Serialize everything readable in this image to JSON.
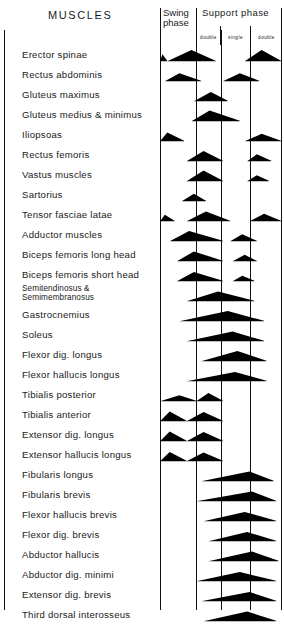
{
  "title": "MUSCLES",
  "header": {
    "swing_phase": "Swing\nphase",
    "support_phase": "Support  phase",
    "sub_phases": [
      "double",
      "single",
      "double"
    ]
  },
  "chart_data": {
    "type": "area",
    "title": "MUSCLES",
    "xlabel": "Gait cycle phase",
    "ylabel": "Muscle",
    "grid": true,
    "legend_position": "none",
    "x_axis": {
      "range": [
        0,
        100
      ],
      "unit": "% gait cycle",
      "phase_boundaries": [
        0,
        30,
        50,
        74,
        100
      ],
      "phase_labels": [
        "Swing phase",
        "double",
        "single",
        "double"
      ],
      "phase_groups": [
        {
          "label": "Swing phase",
          "start": 0,
          "end": 30
        },
        {
          "label": "Support phase",
          "start": 30,
          "end": 100
        }
      ]
    },
    "categories": [
      "Erector spinae",
      "Rectus abdominis",
      "Gluteus maximus",
      "Gluteus medius & minimus",
      "Iliopsoas",
      "Rectus femoris",
      "Vastus muscles",
      "Sartorius",
      "Tensor fasciae latae",
      "Adductor muscles",
      "Biceps femoris long head",
      "Biceps femoris short head",
      "Semitendinosus &\nSemimembranosus",
      "Gastrocnemius",
      "Soleus",
      "Flexor dig. longus",
      "Flexor hallucis longus",
      "Tibialis posterior",
      "Tibialis anterior",
      "Extensor dig. longus",
      "Extensor hallucis longus",
      "Fibularis longus",
      "Fibularis brevis",
      "Flexor hallucis brevis",
      "Flexor dig. brevis",
      "Abductor hallucis",
      "Abductor dig. minimi",
      "Extensor dig. brevis",
      "Third dorsal interosseus"
    ],
    "series": [
      {
        "name": "Erector spinae",
        "bursts": [
          {
            "start": 0,
            "peak": 2,
            "end": 6,
            "amplitude": 0.55
          },
          {
            "start": 6,
            "peak": 26,
            "end": 46,
            "amplitude": 1.0
          },
          {
            "start": 70,
            "peak": 84,
            "end": 100,
            "amplitude": 1.0
          }
        ]
      },
      {
        "name": "Rectus abdominis",
        "bursts": [
          {
            "start": 4,
            "peak": 16,
            "end": 34,
            "amplitude": 0.65
          },
          {
            "start": 52,
            "peak": 66,
            "end": 82,
            "amplitude": 0.65
          }
        ]
      },
      {
        "name": "Gluteus maximus",
        "bursts": [
          {
            "start": 28,
            "peak": 42,
            "end": 56,
            "amplitude": 0.8
          }
        ]
      },
      {
        "name": "Gluteus medius & minimus",
        "bursts": [
          {
            "start": 26,
            "peak": 41,
            "end": 66,
            "amplitude": 0.95
          }
        ]
      },
      {
        "name": "Iliopsoas",
        "bursts": [
          {
            "start": 0,
            "peak": 6,
            "end": 20,
            "amplitude": 0.75
          },
          {
            "start": 70,
            "peak": 84,
            "end": 100,
            "amplitude": 0.6
          }
        ]
      },
      {
        "name": "Rectus femoris",
        "bursts": [
          {
            "start": 22,
            "peak": 36,
            "end": 52,
            "amplitude": 0.9
          },
          {
            "start": 72,
            "peak": 80,
            "end": 92,
            "amplitude": 0.55
          }
        ]
      },
      {
        "name": "Vastus muscles",
        "bursts": [
          {
            "start": 22,
            "peak": 36,
            "end": 52,
            "amplitude": 0.95
          },
          {
            "start": 72,
            "peak": 80,
            "end": 90,
            "amplitude": 0.45
          }
        ]
      },
      {
        "name": "Sartorius",
        "bursts": [
          {
            "start": 18,
            "peak": 28,
            "end": 38,
            "amplitude": 0.6
          }
        ]
      },
      {
        "name": "Tensor fasciae latae",
        "bursts": [
          {
            "start": 0,
            "peak": 4,
            "end": 12,
            "amplitude": 0.5
          },
          {
            "start": 22,
            "peak": 38,
            "end": 58,
            "amplitude": 0.85
          },
          {
            "start": 74,
            "peak": 86,
            "end": 100,
            "amplitude": 0.6
          }
        ]
      },
      {
        "name": "Adductor muscles",
        "bursts": [
          {
            "start": 8,
            "peak": 24,
            "end": 52,
            "amplitude": 0.9
          },
          {
            "start": 58,
            "peak": 68,
            "end": 80,
            "amplitude": 0.55
          }
        ]
      },
      {
        "name": "Biceps femoris long head",
        "bursts": [
          {
            "start": 14,
            "peak": 28,
            "end": 52,
            "amplitude": 0.85
          },
          {
            "start": 60,
            "peak": 70,
            "end": 80,
            "amplitude": 0.5
          }
        ]
      },
      {
        "name": "Biceps femoris short head",
        "bursts": [
          {
            "start": 14,
            "peak": 28,
            "end": 52,
            "amplitude": 0.8
          },
          {
            "start": 60,
            "peak": 68,
            "end": 78,
            "amplitude": 0.4
          }
        ]
      },
      {
        "name": "Semitendinosus & Semimembranosus",
        "bursts": [
          {
            "start": 22,
            "peak": 48,
            "end": 78,
            "amplitude": 0.85
          }
        ]
      },
      {
        "name": "Gastrocnemius",
        "bursts": [
          {
            "start": 16,
            "peak": 56,
            "end": 86,
            "amplitude": 0.9
          }
        ]
      },
      {
        "name": "Soleus",
        "bursts": [
          {
            "start": 22,
            "peak": 60,
            "end": 86,
            "amplitude": 0.85
          }
        ]
      },
      {
        "name": "Flexor dig. longus",
        "bursts": [
          {
            "start": 34,
            "peak": 64,
            "end": 88,
            "amplitude": 0.9
          }
        ]
      },
      {
        "name": "Flexor hallucis longus",
        "bursts": [
          {
            "start": 22,
            "peak": 62,
            "end": 88,
            "amplitude": 0.8
          }
        ]
      },
      {
        "name": "Tibialis posterior",
        "bursts": [
          {
            "start": 0,
            "peak": 16,
            "end": 30,
            "amplitude": 0.45
          },
          {
            "start": 30,
            "peak": 40,
            "end": 52,
            "amplitude": 0.7
          }
        ]
      },
      {
        "name": "Tibialis anterior",
        "bursts": [
          {
            "start": 0,
            "peak": 8,
            "end": 22,
            "amplitude": 0.85
          },
          {
            "start": 22,
            "peak": 36,
            "end": 52,
            "amplitude": 0.8
          }
        ]
      },
      {
        "name": "Extensor dig. longus",
        "bursts": [
          {
            "start": 0,
            "peak": 8,
            "end": 22,
            "amplitude": 0.85
          },
          {
            "start": 22,
            "peak": 36,
            "end": 52,
            "amplitude": 0.8
          }
        ]
      },
      {
        "name": "Extensor hallucis longus",
        "bursts": [
          {
            "start": 0,
            "peak": 8,
            "end": 22,
            "amplitude": 0.8
          },
          {
            "start": 22,
            "peak": 36,
            "end": 52,
            "amplitude": 0.75
          }
        ]
      },
      {
        "name": "Fibularis longus",
        "bursts": [
          {
            "start": 34,
            "peak": 74,
            "end": 94,
            "amplitude": 0.85
          }
        ]
      },
      {
        "name": "Fibularis brevis",
        "bursts": [
          {
            "start": 30,
            "peak": 76,
            "end": 96,
            "amplitude": 0.85
          }
        ]
      },
      {
        "name": "Flexor hallucis brevis",
        "bursts": [
          {
            "start": 36,
            "peak": 70,
            "end": 96,
            "amplitude": 0.8
          }
        ]
      },
      {
        "name": "Flexor dig. brevis",
        "bursts": [
          {
            "start": 40,
            "peak": 72,
            "end": 96,
            "amplitude": 0.8
          }
        ]
      },
      {
        "name": "Abductor hallucis",
        "bursts": [
          {
            "start": 40,
            "peak": 76,
            "end": 98,
            "amplitude": 0.85
          }
        ]
      },
      {
        "name": "Abductor dig. minimi",
        "bursts": [
          {
            "start": 30,
            "peak": 66,
            "end": 96,
            "amplitude": 0.8
          }
        ]
      },
      {
        "name": "Extensor dig. brevis",
        "bursts": [
          {
            "start": 34,
            "peak": 74,
            "end": 96,
            "amplitude": 0.8
          }
        ]
      },
      {
        "name": "Third dorsal interosseus",
        "bursts": [
          {
            "start": 36,
            "peak": 72,
            "end": 96,
            "amplitude": 0.85
          }
        ]
      }
    ],
    "colors": {
      "burst_fill": "#000000",
      "grid": "#111111",
      "background": "#ffffff"
    }
  }
}
